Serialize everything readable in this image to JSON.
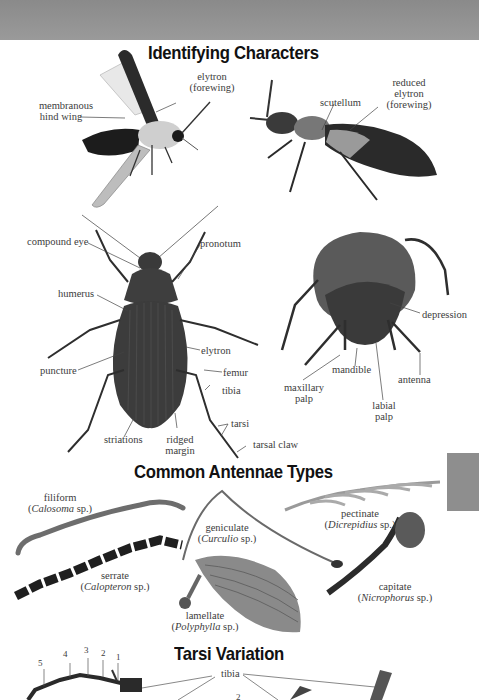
{
  "header": {
    "bar_color": "#919191"
  },
  "side_tab": {
    "color": "#8e8e8e"
  },
  "sections": {
    "identifying": {
      "title": "Identifying Characters",
      "firefly_labels": {
        "elytron": "elytron",
        "forewing": "(forewing)",
        "hind_wing_1": "membranous",
        "hind_wing_2": "hind wing"
      },
      "rove_labels": {
        "scutellum": "scutellum",
        "reduced_1": "reduced",
        "reduced_2": "elytron",
        "reduced_3": "(forewing)"
      },
      "ground_beetle_labels": {
        "compound_eye": "compound eye",
        "pronotum": "pronotum",
        "humerus": "humerus",
        "elytron": "elytron",
        "puncture": "puncture",
        "femur": "femur",
        "tibia": "tibia",
        "tarsi": "tarsi",
        "tarsal_claw": "tarsal claw",
        "striations": "striations",
        "ridged_1": "ridged",
        "ridged_2": "margin"
      },
      "scarab_labels": {
        "depression": "depression",
        "mandible": "mandible",
        "antenna": "antenna",
        "maxillary_1": "maxillary",
        "maxillary_2": "palp",
        "labial_1": "labial",
        "labial_2": "palp"
      }
    },
    "antennae": {
      "title": "Common Antennae Types",
      "types": [
        {
          "name": "filiform",
          "genus": "Calosoma",
          "suffix": " sp.)"
        },
        {
          "name": "serrate",
          "genus": "Calopteron",
          "suffix": " sp.)"
        },
        {
          "name": "geniculate",
          "genus": "Curculio",
          "suffix": " sp.)"
        },
        {
          "name": "pectinate",
          "genus": "Dicrepidius",
          "suffix": " sp.)"
        },
        {
          "name": "lamellate",
          "genus": "Polyphylla",
          "suffix": " sp.)"
        },
        {
          "name": "capitate",
          "genus": "Nicrophorus",
          "suffix": " sp.)"
        }
      ]
    },
    "tarsi": {
      "title": "Tarsi Variation",
      "segment_numbers": [
        "5",
        "4",
        "3",
        "2",
        "1"
      ],
      "tibia_label": "tibia",
      "partial_number": "2"
    }
  }
}
